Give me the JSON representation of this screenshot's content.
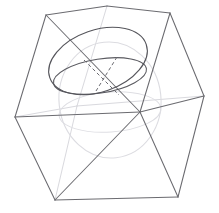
{
  "figure": {
    "type": "3d-wireframe-diagram",
    "background_color": "#ffffff",
    "canvas": {
      "width": 219,
      "height": 213
    }
  },
  "colors": {
    "cube_visible_edge": "#6b6b70",
    "cube_hidden_edge": "#d9d9de",
    "sphere_outline": "#dcdce1",
    "sphere_hidden_equator": "#dedee3",
    "great_circle": "#55555b",
    "second_circle": "#5a5a60",
    "axis": "#6a6a70"
  },
  "cube": {
    "name": "wireframe-cube",
    "vertices": {
      "top_back": [
        107,
        6
      ],
      "top_left": [
        46,
        15
      ],
      "top_right": [
        170,
        13
      ],
      "top_front": [
        140,
        112
      ],
      "mid_left": [
        15,
        117
      ],
      "mid_right": [
        204,
        96
      ],
      "bottom_left": [
        55,
        200
      ],
      "bottom_right": [
        178,
        197
      ]
    },
    "visible_edges": [
      {
        "name": "top-back-to-top-left",
        "from": [
          107,
          6
        ],
        "to": [
          46,
          15
        ]
      },
      {
        "name": "top-back-to-top-right",
        "from": [
          107,
          6
        ],
        "to": [
          170,
          13
        ]
      },
      {
        "name": "top-left-to-mid-left",
        "from": [
          46,
          15
        ],
        "to": [
          15,
          117
        ]
      },
      {
        "name": "top-right-to-mid-right",
        "from": [
          170,
          13
        ],
        "to": [
          204,
          96
        ]
      },
      {
        "name": "top-left-to-top-front",
        "from": [
          46,
          15
        ],
        "to": [
          140,
          112
        ]
      },
      {
        "name": "top-right-to-top-front",
        "from": [
          170,
          13
        ],
        "to": [
          140,
          112
        ]
      },
      {
        "name": "mid-left-to-top-front",
        "from": [
          15,
          117
        ],
        "to": [
          140,
          112
        ]
      },
      {
        "name": "mid-right-to-top-front",
        "from": [
          204,
          96
        ],
        "to": [
          140,
          112
        ]
      },
      {
        "name": "mid-left-to-bottom-left",
        "from": [
          15,
          117
        ],
        "to": [
          55,
          200
        ]
      },
      {
        "name": "mid-right-to-bottom-right",
        "from": [
          204,
          96
        ],
        "to": [
          178,
          197
        ]
      },
      {
        "name": "top-front-to-bottom-left",
        "from": [
          140,
          112
        ],
        "to": [
          55,
          200
        ]
      },
      {
        "name": "top-front-to-bottom-right",
        "from": [
          140,
          112
        ],
        "to": [
          178,
          197
        ]
      },
      {
        "name": "bottom-left-to-bottom-right",
        "from": [
          55,
          200
        ],
        "to": [
          178,
          197
        ]
      }
    ],
    "hidden_edges": [
      {
        "name": "hidden-back-vertical",
        "from": [
          107,
          6
        ],
        "to": [
          77,
          106
        ]
      },
      {
        "name": "hidden-back-to-mid-left",
        "from": [
          77,
          106
        ],
        "to": [
          15,
          117
        ]
      },
      {
        "name": "hidden-back-to-mid-right",
        "from": [
          77,
          106
        ],
        "to": [
          204,
          96
        ]
      },
      {
        "name": "hidden-back-to-bottom-left",
        "from": [
          77,
          106
        ],
        "to": [
          55,
          200
        ]
      }
    ]
  },
  "sphere": {
    "name": "inscribed-sphere",
    "outline": {
      "cx": 110,
      "cy": 100,
      "rx": 51,
      "ry": 58,
      "rotation": -6
    },
    "hidden_equator": {
      "cx": 110,
      "cy": 112,
      "rx": 51,
      "ry": 20,
      "rotation": -4
    }
  },
  "great_circle": {
    "name": "tilted-great-circle",
    "cx": 98,
    "cy": 61,
    "rx": 51,
    "ry": 31,
    "rotation": -19
  },
  "second_circle": {
    "name": "secondary-great-circle-arc",
    "cx": 100,
    "cy": 76,
    "rx": 47,
    "ry": 17,
    "rotation": -9
  },
  "axes": [
    {
      "name": "axis-major-dashed",
      "from": [
        84,
        60
      ],
      "to": [
        119,
        95
      ]
    },
    {
      "name": "axis-minor-dashed",
      "from": [
        117,
        57
      ],
      "to": [
        96,
        91
      ]
    }
  ]
}
